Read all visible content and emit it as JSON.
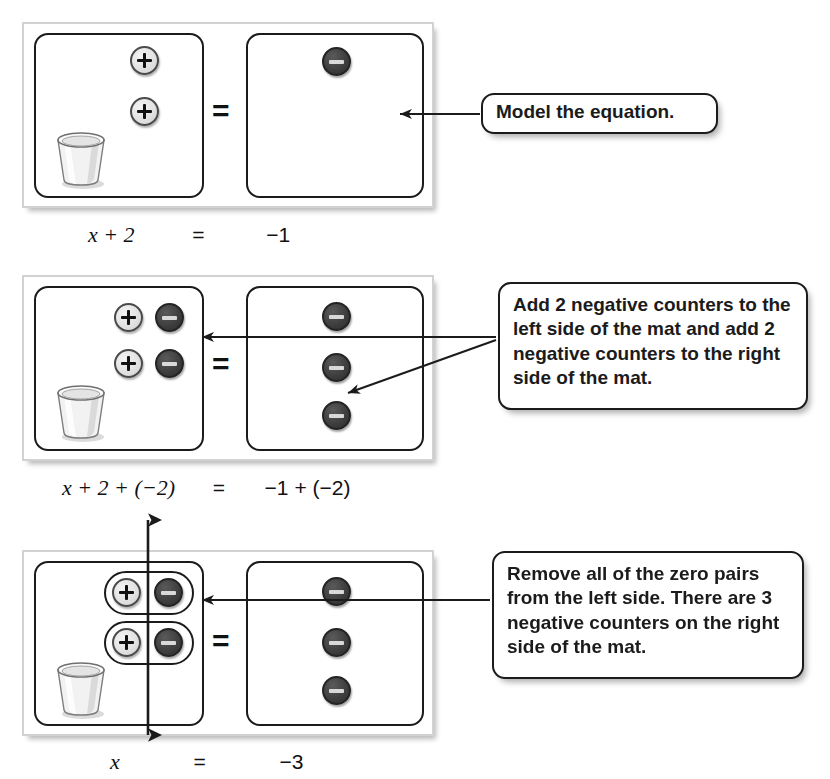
{
  "document": {
    "title": "Solving an equation with algebra counters and a cup",
    "topic": "x + 2 = -1"
  },
  "steps": [
    {
      "id": "step-1",
      "equation": {
        "left": "x + 2",
        "relation": "=",
        "right": "−1"
      },
      "left_mat": {
        "cup": true,
        "positive_counters": 2,
        "negative_counters": 0,
        "zero_pairs": 0
      },
      "right_mat": {
        "positive_counters": 0,
        "negative_counters": 1
      },
      "callout": {
        "text": "Model the equation."
      }
    },
    {
      "id": "step-2",
      "equation": {
        "left": "x + 2 + (−2)",
        "relation": "=",
        "right": "−1 + (−2)"
      },
      "left_mat": {
        "cup": true,
        "positive_counters": 2,
        "negative_counters": 2,
        "zero_pairs": 0
      },
      "right_mat": {
        "positive_counters": 0,
        "negative_counters": 3
      },
      "callout": {
        "text": "Add 2 negative counters to the left side of the mat and add 2 negative counters to the right side of the mat."
      }
    },
    {
      "id": "step-3",
      "equation": {
        "left": "x",
        "relation": "=",
        "right": "−3"
      },
      "left_mat": {
        "cup": true,
        "positive_counters": 2,
        "negative_counters": 2,
        "zero_pairs": 2
      },
      "right_mat": {
        "positive_counters": 0,
        "negative_counters": 3
      },
      "callout": {
        "text": "Remove all of the zero pairs from the left side. There are 3 negative counters on the right side of the mat."
      }
    }
  ],
  "symbols": {
    "equals": "=",
    "plus_counter": "plus-counter-icon",
    "minus_counter": "minus-counter-icon",
    "cup": "cup-icon",
    "arrow": "arrow-left-icon",
    "double_arrow": "double-headed-arrow-icon"
  },
  "colors": {
    "positive_counter_fill": "#e2e2e2",
    "positive_counter_stroke": "#4a4a4a",
    "negative_counter_fill": "#3f3f3f",
    "negative_counter_stroke": "#242424",
    "minus_bar": "#d9d9d9",
    "panel_stroke": "#1b1b1b",
    "mat_frame_stroke": "#d2d2d2",
    "text": "#1b1b1b",
    "page_background": "#ffffff"
  }
}
